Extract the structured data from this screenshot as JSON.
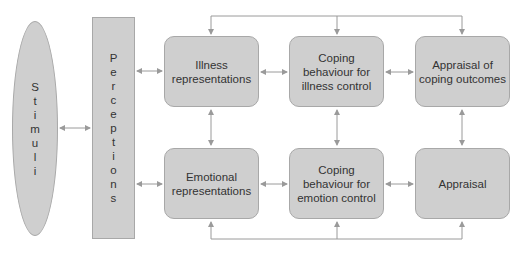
{
  "diagram": {
    "stimuli": {
      "label": "Stimuli",
      "letters": [
        "S",
        "t",
        "i",
        "m",
        "u",
        "l",
        "i"
      ]
    },
    "perceptions": {
      "label": "Perceptions",
      "letters": [
        "P",
        "e",
        "r",
        "c",
        "e",
        "p",
        "t",
        "i",
        "o",
        "n",
        "s"
      ]
    },
    "boxes": [
      {
        "id": "illness-representations",
        "label": "Illness representations"
      },
      {
        "id": "coping-illness-control",
        "label": "Coping behaviour for illness control"
      },
      {
        "id": "appraisal-coping-outcomes",
        "label": "Appraisal of coping outcomes"
      },
      {
        "id": "emotional-representations",
        "label": "Emotional representations"
      },
      {
        "id": "coping-emotion-control",
        "label": "Coping behaviour for emotion control"
      },
      {
        "id": "appraisal",
        "label": "Appraisal"
      }
    ],
    "connections": [
      "Stimuli <-> Perceptions",
      "Perceptions <-> Illness representations",
      "Perceptions <-> Emotional representations",
      "Illness representations <-> Coping behaviour for illness control",
      "Coping behaviour for illness control <-> Appraisal of coping outcomes",
      "Emotional representations <-> Coping behaviour for emotion control",
      "Coping behaviour for emotion control <-> Appraisal",
      "Illness representations <-> Emotional representations",
      "Coping behaviour for illness control <-> Coping behaviour for emotion control",
      "Appraisal of coping outcomes <-> Appraisal",
      "Top feedback loop -> all top-row boxes",
      "Bottom feedback loop -> all bottom-row boxes"
    ],
    "colors": {
      "fill": "#cfcfcf",
      "stroke": "#a8a8a8",
      "line": "#9a9a9a",
      "text": "#333333"
    }
  }
}
